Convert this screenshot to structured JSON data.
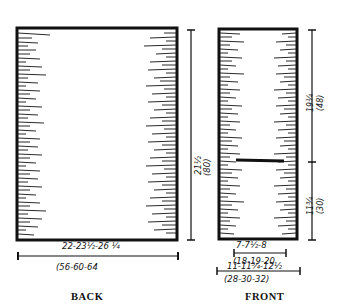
{
  "pieces": {
    "back": {
      "label": "BACK",
      "width_in": "22-23½-26 ¼",
      "width_cm": "(56-60-64",
      "length_in": "21½",
      "length_cm": "(80)"
    },
    "front": {
      "label": "FRONT",
      "upper_in": "19¼",
      "upper_cm": "(48)",
      "lower_in": "11¾",
      "lower_cm": "(30)",
      "neck_width_in": "7-7½-8",
      "neck_width_cm": "(18-19-20",
      "width_in": "11-11¾-12½",
      "width_cm": "(28-30-32)"
    }
  },
  "colors": {
    "ink": "#111111",
    "paper": "#ffffff"
  }
}
